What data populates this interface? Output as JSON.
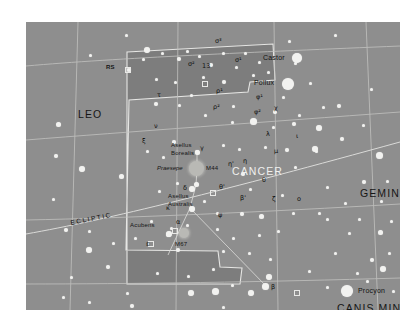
{
  "chart_data": {
    "type": "scatter",
    "xlabel": "Right Ascension",
    "ylabel": "Declination",
    "grid": true,
    "legend": "none",
    "constellations": [
      {
        "name": "CANCER",
        "x": 232,
        "y": 150,
        "highlighted": true
      },
      {
        "name": "LEO",
        "x": 78,
        "y": 93,
        "highlighted": false
      },
      {
        "name": "GEMINI",
        "x": 360,
        "y": 172,
        "highlighted": false
      },
      {
        "name": "CANIS MINOR",
        "x": 363,
        "y": 307,
        "highlighted": false
      }
    ],
    "named_stars": [
      {
        "name": "Castor",
        "x": 274,
        "y": 57,
        "star_x": 297,
        "star_y": 58,
        "mag_radius": 5.0
      },
      {
        "name": "Pollux",
        "x": 268,
        "y": 82,
        "star_x": 288,
        "star_y": 84,
        "mag_radius": 5.8
      },
      {
        "name": "Procyon",
        "x": 368,
        "y": 291,
        "star_x": 347,
        "star_y": 291,
        "mag_radius": 5.6
      },
      {
        "name": "Asellus Borealis",
        "x": 176,
        "y": 146,
        "star_x": 197,
        "star_y": 152,
        "mag_radius": 2.4
      },
      {
        "name": "Asellus Australis",
        "x": 176,
        "y": 195,
        "star_x": 190,
        "star_y": 187,
        "mag_radius": 2.6
      },
      {
        "name": "Acubens",
        "x": 136,
        "y": 226,
        "star_x": 168,
        "star_y": 233,
        "mag_radius": 2.6
      }
    ],
    "deep_sky_objects": [
      {
        "name": "Praesepe",
        "designation": "M44",
        "x": 196,
        "y": 169,
        "radius": 7.5,
        "label_left_x": 162,
        "label_right_x": 208
      },
      {
        "name": "M67",
        "designation": "M67",
        "x": 184,
        "y": 235,
        "radius": 5.0,
        "label_x": 176,
        "label_y": 244
      }
    ],
    "variable_stars": [
      {
        "name": "RS",
        "x": 110,
        "y": 67,
        "star_x": 126,
        "star_y": 68
      }
    ],
    "bayer_letters": [
      {
        "g": "σ³",
        "x": 215,
        "y": 38
      },
      {
        "g": "σ²",
        "x": 188,
        "y": 61
      },
      {
        "g": "σ¹",
        "x": 235,
        "y": 57
      },
      {
        "g": "13",
        "x": 202,
        "y": 63
      },
      {
        "g": "τ",
        "x": 157,
        "y": 92
      },
      {
        "g": "ρ¹",
        "x": 216,
        "y": 88
      },
      {
        "g": "ρ²",
        "x": 213,
        "y": 104
      },
      {
        "g": "φ¹",
        "x": 256,
        "y": 94
      },
      {
        "g": "φ²",
        "x": 254,
        "y": 109
      },
      {
        "g": "χ",
        "x": 274,
        "y": 105
      },
      {
        "g": "ν",
        "x": 154,
        "y": 123
      },
      {
        "g": "ξ",
        "x": 142,
        "y": 138
      },
      {
        "g": "λ",
        "x": 266,
        "y": 131
      },
      {
        "g": "γ",
        "x": 200,
        "y": 145
      },
      {
        "g": "η",
        "x": 243,
        "y": 158
      },
      {
        "g": "δ",
        "x": 183,
        "y": 185
      },
      {
        "g": "μ",
        "x": 274,
        "y": 148
      },
      {
        "g": "θ",
        "x": 262,
        "y": 177
      },
      {
        "g": "η'",
        "x": 228,
        "y": 161
      },
      {
        "g": "θ'",
        "x": 219,
        "y": 184
      },
      {
        "g": "ι",
        "x": 296,
        "y": 133
      },
      {
        "g": "κ",
        "x": 166,
        "y": 205
      },
      {
        "g": "α",
        "x": 176,
        "y": 219
      },
      {
        "g": "β",
        "x": 266,
        "y": 286
      },
      {
        "g": "ζ",
        "x": 272,
        "y": 196
      },
      {
        "g": "ε",
        "x": 146,
        "y": 241
      },
      {
        "g": "β'",
        "x": 240,
        "y": 195
      },
      {
        "g": "ο",
        "x": 297,
        "y": 196
      },
      {
        "g": "ψ",
        "x": 218,
        "y": 212
      }
    ],
    "lines": [
      {
        "name": "ECLIPTIC",
        "label_x": 72,
        "label_y": 219,
        "angle": -9
      }
    ],
    "axes_note": "Coordinate grid drawn as pale curved gridlines; no numeric tick labels printed on this plate.",
    "colors": {
      "sky_outer": "#8e8e8e",
      "sky_cancer": "#7e7e7e",
      "star": "#f2f2f0",
      "gridline": "#c9c9c7",
      "boundary": "#e4e4e2",
      "figure_line": "#dcdcda",
      "label_dark": "#141414",
      "label_light": "#f0f0ee",
      "page_background": "#ffffff"
    }
  },
  "page": {
    "background": "#ffffff",
    "frame": {
      "x": 26,
      "y": 22,
      "width": 374,
      "height": 288
    }
  }
}
